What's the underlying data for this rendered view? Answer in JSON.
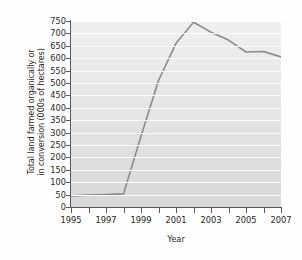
{
  "chart_data": {
    "type": "line",
    "title": "",
    "xlabel": "Year",
    "ylabel": "Total land farmed organically or in conversion (000s of hectares)",
    "ylabel_line1": "Total land farmed organically or",
    "ylabel_line2": "in conversion (000s of hectares)",
    "x": [
      1995,
      1996,
      1997,
      1998,
      1999,
      2000,
      2001,
      2002,
      2003,
      2004,
      2005,
      2006,
      2007
    ],
    "values": [
      45,
      48,
      50,
      53,
      285,
      510,
      660,
      745,
      705,
      673,
      625,
      627,
      605
    ],
    "series": [
      {
        "name": "Total land farmed organically or in conversion",
        "values": [
          45,
          48,
          50,
          53,
          285,
          510,
          660,
          745,
          705,
          673,
          625,
          627,
          605
        ]
      }
    ],
    "xlim": [
      1995,
      2007
    ],
    "ylim": [
      0,
      750
    ],
    "ytick_values": [
      0,
      50,
      100,
      150,
      200,
      250,
      300,
      350,
      400,
      450,
      500,
      550,
      600,
      650,
      700,
      750
    ],
    "ytick_labels": [
      "0",
      "50",
      "100",
      "150",
      "200",
      "250",
      "300",
      "350",
      "400",
      "450",
      "500",
      "550",
      "600",
      "650",
      "700",
      "750"
    ],
    "xtick_values": [
      1995,
      1996,
      1997,
      1998,
      1999,
      2000,
      2001,
      2002,
      2003,
      2004,
      2005,
      2006,
      2007
    ],
    "xtick_labels_shown": [
      "1995",
      "1997",
      "1999",
      "2001",
      "2003",
      "2005",
      "2007"
    ],
    "grid": true,
    "grid_orientation": "horizontal",
    "legend": false,
    "legend_position": "none",
    "line_color": "#8a8a8a",
    "plot_background": "#e6e6e6",
    "gridline_color": "#fbfbfb",
    "axis_color": "#58595b",
    "text_color": "#231f20"
  }
}
